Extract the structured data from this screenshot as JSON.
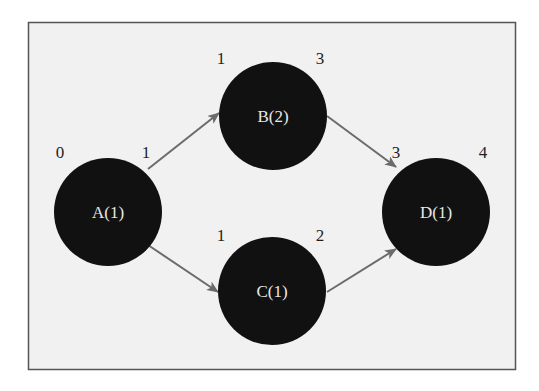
{
  "diagram": {
    "type": "activity-on-node network",
    "colors": {
      "background": "#ffffff",
      "frame_fill": "#f1f1f1",
      "frame_border": "#555555",
      "node_fill": "#111111",
      "node_text": "#e8e8e8",
      "edge": "#6b6b6b",
      "label_text": "#1e1e1e"
    },
    "nodes": [
      {
        "id": "A",
        "label": "A(1)",
        "early_start": "0",
        "early_finish": "1"
      },
      {
        "id": "B",
        "label": "B(2)",
        "early_start": "1",
        "early_finish": "3"
      },
      {
        "id": "C",
        "label": "C(1)",
        "early_start": "1",
        "early_finish": "2"
      },
      {
        "id": "D",
        "label": "D(1)",
        "early_start": "3",
        "early_finish": "4"
      }
    ],
    "edges": [
      {
        "from": "A",
        "to": "B"
      },
      {
        "from": "A",
        "to": "C"
      },
      {
        "from": "B",
        "to": "D"
      },
      {
        "from": "C",
        "to": "D"
      }
    ]
  }
}
